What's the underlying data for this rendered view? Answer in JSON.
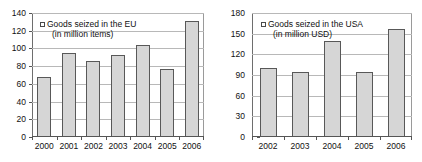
{
  "chart_data": [
    {
      "type": "bar",
      "id": "eu-chart",
      "title": "",
      "legend": {
        "label_line1": "Goods seized in the EU",
        "label_line2": "(in million items)",
        "position": "top-left",
        "swatch_color": "#d6d6d6"
      },
      "categories": [
        "2000",
        "2001",
        "2002",
        "2003",
        "2004",
        "2005",
        "2006"
      ],
      "values": [
        68,
        95,
        86,
        93,
        104,
        77,
        131
      ],
      "xlabel": "",
      "ylabel": "",
      "ylim": [
        0,
        140
      ],
      "yticks": [
        0,
        20,
        40,
        60,
        80,
        100,
        120,
        140
      ],
      "ytick_labels": [
        "0",
        "20",
        "40",
        "60",
        "80",
        "100",
        "120",
        "140"
      ],
      "grid": true,
      "bar_color": "#d6d6d6",
      "bar_edge_color": "#585858"
    },
    {
      "type": "bar",
      "id": "usa-chart",
      "title": "",
      "legend": {
        "label_line1": "Goods seized in the USA",
        "label_line2": "(in million USD)",
        "position": "top-left",
        "swatch_color": "#d6d6d6"
      },
      "categories": [
        "2002",
        "2003",
        "2004",
        "2005",
        "2006"
      ],
      "values": [
        100,
        95,
        140,
        95,
        157
      ],
      "xlabel": "",
      "ylabel": "",
      "ylim": [
        0,
        180
      ],
      "yticks": [
        0,
        30,
        60,
        90,
        120,
        150,
        180
      ],
      "ytick_labels": [
        "0",
        "30",
        "60",
        "90",
        "120",
        "150",
        "180"
      ],
      "grid": true,
      "bar_color": "#d6d6d6",
      "bar_edge_color": "#585858"
    }
  ]
}
